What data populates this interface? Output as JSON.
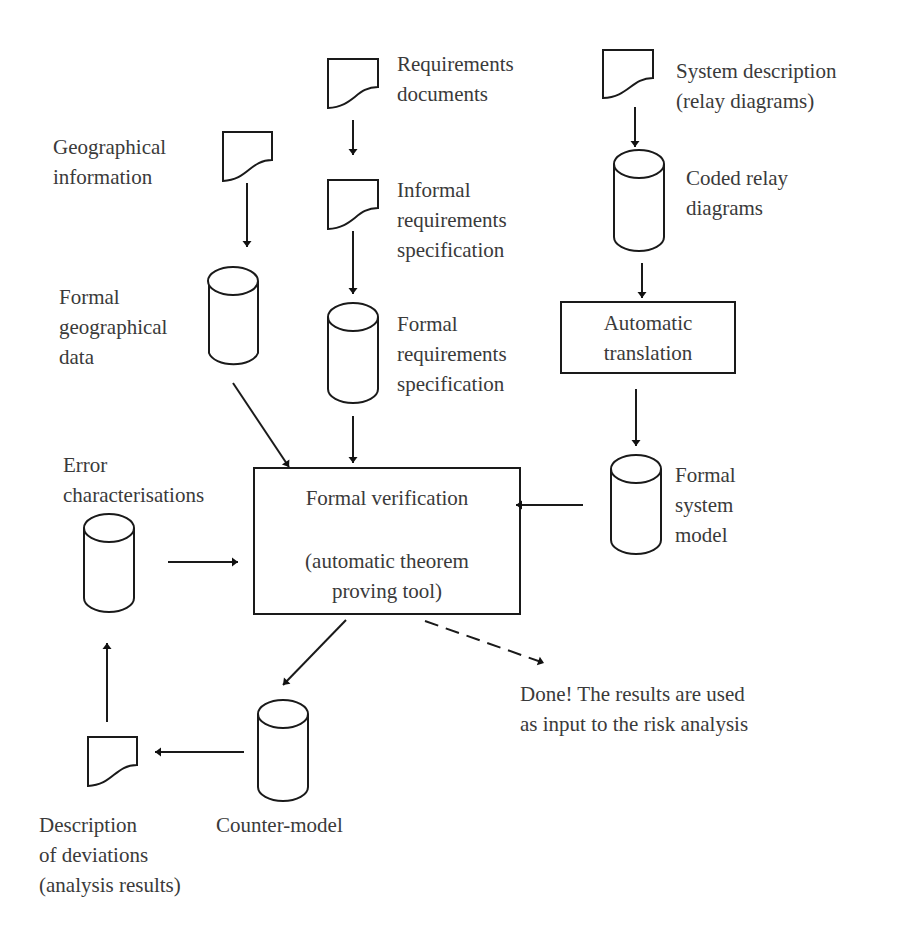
{
  "diagram": {
    "type": "data-flow",
    "nodes": {
      "requirements_documents": {
        "shape": "document",
        "label": [
          "Requirements",
          "documents"
        ]
      },
      "system_description": {
        "shape": "document",
        "label": [
          "System description",
          "(relay diagrams)"
        ]
      },
      "geographical_information": {
        "shape": "document",
        "label": [
          "Geographical",
          "information"
        ]
      },
      "informal_requirements": {
        "shape": "document",
        "label": [
          "Informal",
          "requirements",
          "specification"
        ]
      },
      "coded_relay_diagrams": {
        "shape": "database",
        "label": [
          "Coded relay",
          "diagrams"
        ]
      },
      "formal_geographical_data": {
        "shape": "database",
        "label": [
          "Formal",
          "geographical",
          "data"
        ]
      },
      "formal_requirements": {
        "shape": "database",
        "label": [
          "Formal",
          "requirements",
          "specification"
        ]
      },
      "automatic_translation": {
        "shape": "process",
        "label": [
          "Automatic",
          "translation"
        ]
      },
      "error_characterisations": {
        "shape": "database",
        "label": [
          "Error",
          "characterisations"
        ]
      },
      "formal_verification": {
        "shape": "process",
        "label": [
          "Formal verification",
          "(automatic theorem",
          "proving tool)"
        ]
      },
      "formal_system_model": {
        "shape": "database",
        "label": [
          "Formal",
          "system",
          "model"
        ]
      },
      "counter_model": {
        "shape": "database",
        "label": [
          "Counter-model"
        ]
      },
      "description_of_deviations": {
        "shape": "document",
        "label": [
          "Description",
          "of deviations",
          "(analysis results)"
        ]
      },
      "done_note": {
        "shape": "text",
        "label": [
          "Done! The results are used",
          "as input to the risk analysis"
        ]
      }
    },
    "edges": [
      {
        "from": "requirements_documents",
        "to": "informal_requirements",
        "style": "solid"
      },
      {
        "from": "informal_requirements",
        "to": "formal_requirements",
        "style": "solid"
      },
      {
        "from": "geographical_information",
        "to": "formal_geographical_data",
        "style": "solid"
      },
      {
        "from": "system_description",
        "to": "coded_relay_diagrams",
        "style": "solid"
      },
      {
        "from": "coded_relay_diagrams",
        "to": "automatic_translation",
        "style": "solid"
      },
      {
        "from": "automatic_translation",
        "to": "formal_system_model",
        "style": "solid"
      },
      {
        "from": "formal_geographical_data",
        "to": "formal_verification",
        "style": "solid"
      },
      {
        "from": "formal_requirements",
        "to": "formal_verification",
        "style": "solid"
      },
      {
        "from": "formal_system_model",
        "to": "formal_verification",
        "style": "solid"
      },
      {
        "from": "error_characterisations",
        "to": "formal_verification",
        "style": "solid"
      },
      {
        "from": "formal_verification",
        "to": "counter_model",
        "style": "solid"
      },
      {
        "from": "formal_verification",
        "to": "done_note",
        "style": "dashed"
      },
      {
        "from": "counter_model",
        "to": "description_of_deviations",
        "style": "solid"
      },
      {
        "from": "description_of_deviations",
        "to": "error_characterisations",
        "style": "solid"
      }
    ]
  }
}
